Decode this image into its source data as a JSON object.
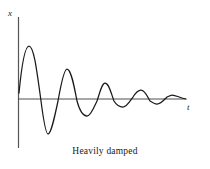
{
  "figure": {
    "caption": "Heavily damped",
    "y_axis_label": "x",
    "x_axis_label": "t",
    "line_color": "#1a1a1a",
    "axis_color": "#555555",
    "background_color": "#ffffff"
  },
  "chart_data": {
    "type": "line",
    "title": "Heavily damped",
    "xlabel": "t",
    "ylabel": "x",
    "grid": false,
    "legend": null,
    "axes": {
      "x_axis_y_pixel": 99,
      "y_axis_x_pixel": 18,
      "x_axis_extent_px": [
        18,
        186
      ],
      "y_axis_extent_px": [
        17,
        148
      ],
      "ticks": [],
      "tick_labels": []
    },
    "extrema": [
      {
        "index": 1,
        "type": "peak",
        "x_px": 29,
        "y_px": 46,
        "amplitude_rel": 1.0
      },
      {
        "index": 1,
        "type": "trough",
        "x_px": 48,
        "y_px": 134,
        "amplitude_rel": -0.66
      },
      {
        "index": 2,
        "type": "peak",
        "x_px": 67,
        "y_px": 69,
        "amplitude_rel": 0.57
      },
      {
        "index": 2,
        "type": "trough",
        "x_px": 87,
        "y_px": 116,
        "amplitude_rel": -0.32
      },
      {
        "index": 3,
        "type": "peak",
        "x_px": 105,
        "y_px": 83,
        "amplitude_rel": 0.3
      },
      {
        "index": 3,
        "type": "trough",
        "x_px": 123,
        "y_px": 107,
        "amplitude_rel": -0.15
      },
      {
        "index": 4,
        "type": "peak",
        "x_px": 141,
        "y_px": 90,
        "amplitude_rel": 0.17
      },
      {
        "index": 4,
        "type": "trough",
        "x_px": 157,
        "y_px": 104,
        "amplitude_rel": -0.09
      },
      {
        "index": 5,
        "type": "peak",
        "x_px": 172,
        "y_px": 95,
        "amplitude_rel": 0.07
      }
    ],
    "curve_path": "M 19,93 C 21,72 24,46 29,46 C 34,46 37,72 41,101 C 44,124 46,134 48,134 C 51,134 54,120 58,101 C 61,84 64,69 67,69 C 71,69 74,85 77,101 C 80,112 84,116 87,116 C 91,116 94,107 97,101 C 100,92 102,83 105,83 C 109,83 111,93 114,101 C 117,106 120,107 123,107 C 127,107 130,101 133,97 C 136,92 138,90 141,90 C 145,90 147,96 150,101 C 153,103 155,104 157,104 C 161,104 164,100 167,97 C 169,96 171,95 172,95 C 176,95 180,98 186,99"
  }
}
